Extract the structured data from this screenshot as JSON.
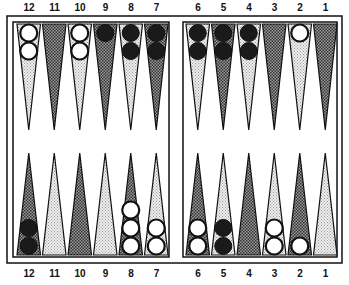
{
  "board": {
    "colors": {
      "dark_point": "#555555",
      "light_point": "#d8d8d8",
      "black_checker": "#1a1a1a",
      "white_checker": "#ffffff",
      "frame": "#111111"
    },
    "top_labels": [
      "12",
      "11",
      "10",
      "9",
      "8",
      "7",
      "6",
      "5",
      "4",
      "3",
      "2",
      "1"
    ],
    "bottom_labels": [
      "12",
      "11",
      "10",
      "9",
      "8",
      "7",
      "6",
      "5",
      "4",
      "3",
      "2",
      "1"
    ],
    "top_points": [
      {
        "label": "12",
        "shade": "light",
        "checkers": {
          "color": "white",
          "count": 2
        }
      },
      {
        "label": "11",
        "shade": "dark",
        "checkers": {
          "color": "none",
          "count": 0
        }
      },
      {
        "label": "10",
        "shade": "light",
        "checkers": {
          "color": "white",
          "count": 2
        }
      },
      {
        "label": "9",
        "shade": "dark",
        "checkers": {
          "color": "black",
          "count": 1
        }
      },
      {
        "label": "8",
        "shade": "light",
        "checkers": {
          "color": "black",
          "count": 2
        }
      },
      {
        "label": "7",
        "shade": "dark",
        "checkers": {
          "color": "black",
          "count": 2
        }
      },
      {
        "label": "6",
        "shade": "light",
        "checkers": {
          "color": "black",
          "count": 2
        }
      },
      {
        "label": "5",
        "shade": "dark",
        "checkers": {
          "color": "black",
          "count": 2
        }
      },
      {
        "label": "4",
        "shade": "light",
        "checkers": {
          "color": "black",
          "count": 2
        }
      },
      {
        "label": "3",
        "shade": "dark",
        "checkers": {
          "color": "none",
          "count": 0
        }
      },
      {
        "label": "2",
        "shade": "light",
        "checkers": {
          "color": "white",
          "count": 1
        }
      },
      {
        "label": "1",
        "shade": "dark",
        "checkers": {
          "color": "none",
          "count": 0
        }
      }
    ],
    "bottom_points": [
      {
        "label": "12",
        "shade": "dark",
        "checkers": {
          "color": "black",
          "count": 2
        }
      },
      {
        "label": "11",
        "shade": "light",
        "checkers": {
          "color": "none",
          "count": 0
        }
      },
      {
        "label": "10",
        "shade": "dark",
        "checkers": {
          "color": "none",
          "count": 0
        }
      },
      {
        "label": "9",
        "shade": "light",
        "checkers": {
          "color": "none",
          "count": 0
        }
      },
      {
        "label": "8",
        "shade": "dark",
        "checkers": {
          "color": "white",
          "count": 3
        }
      },
      {
        "label": "7",
        "shade": "light",
        "checkers": {
          "color": "white",
          "count": 2
        }
      },
      {
        "label": "6",
        "shade": "dark",
        "checkers": {
          "color": "white",
          "count": 2
        }
      },
      {
        "label": "5",
        "shade": "light",
        "checkers": {
          "color": "black",
          "count": 2
        }
      },
      {
        "label": "4",
        "shade": "dark",
        "checkers": {
          "color": "none",
          "count": 0
        }
      },
      {
        "label": "3",
        "shade": "light",
        "checkers": {
          "color": "white",
          "count": 2
        }
      },
      {
        "label": "2",
        "shade": "dark",
        "checkers": {
          "color": "white",
          "count": 1
        }
      },
      {
        "label": "1",
        "shade": "light",
        "checkers": {
          "color": "none",
          "count": 0
        }
      }
    ]
  }
}
